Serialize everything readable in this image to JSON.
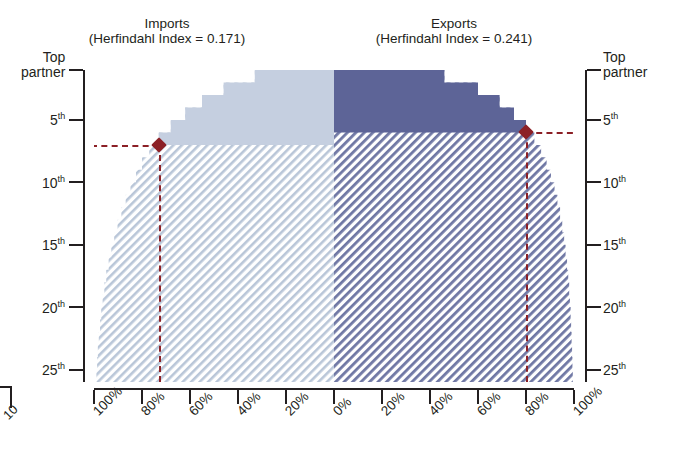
{
  "figure": {
    "background": "#ffffff",
    "accent_marker_color": "#8c2026",
    "imports_fill_color": "#c5cfe0",
    "exports_fill_color": "#5d6497",
    "axis_color": "#231f20"
  },
  "panels": {
    "left": {
      "title": "Imports",
      "subtitle": "(Herfindahl Index = 0.171)"
    },
    "right": {
      "title": "Exports",
      "subtitle": "(Herfindahl Index = 0.241)"
    }
  },
  "y_axis_left": {
    "top_label_line1": "Top",
    "top_label_line2": "partner",
    "ticks": [
      {
        "value": 1,
        "label": "Top partner",
        "two_line": true
      },
      {
        "value": 5,
        "label": "5",
        "suffix": "th"
      },
      {
        "value": 10,
        "label": "10",
        "suffix": "th"
      },
      {
        "value": 15,
        "label": "15",
        "suffix": "th"
      },
      {
        "value": 20,
        "label": "20",
        "suffix": "th"
      },
      {
        "value": 25,
        "label": "25",
        "suffix": "th"
      }
    ]
  },
  "y_axis_right": {
    "top_label_line1": "Top",
    "top_label_line2": "partner",
    "ticks": [
      {
        "value": 1,
        "label": "Top partner",
        "two_line": true
      },
      {
        "value": 5,
        "label": "5",
        "suffix": "th"
      },
      {
        "value": 10,
        "label": "10",
        "suffix": "th"
      },
      {
        "value": 15,
        "label": "15",
        "suffix": "th"
      },
      {
        "value": 20,
        "label": "20",
        "suffix": "th"
      },
      {
        "value": 25,
        "label": "25",
        "suffix": "th"
      }
    ]
  },
  "x_axis": {
    "tick_labels": [
      "100%",
      "80%",
      "60%",
      "40%",
      "20%",
      "0%",
      "20%",
      "40%",
      "60%",
      "80%",
      "100%"
    ]
  },
  "markers": {
    "imports": {
      "rank": 6,
      "share_label": "80%"
    },
    "exports": {
      "rank": 5,
      "share_label": "80%"
    }
  },
  "crop_artifact": {
    "label": "10"
  },
  "chart_data": {
    "type": "area",
    "subtitle": "",
    "xlabel": "",
    "ylabel": "Partner rank",
    "grid": false,
    "legend_position": "top",
    "orientation": "back-to-back cumulative step (butterfly)",
    "y_inverted": true,
    "ylim": [
      1,
      25
    ],
    "y_tick_values": [
      1,
      5,
      10,
      15,
      20,
      25
    ],
    "y_tick_labels": [
      "Top partner",
      "5th",
      "10th",
      "15th",
      "20th",
      "25th"
    ],
    "x_tick_labels": [
      "100%",
      "80%",
      "60%",
      "40%",
      "20%",
      "0%",
      "20%",
      "40%",
      "60%",
      "80%",
      "100%"
    ],
    "x_left_range_percent": [
      100,
      0
    ],
    "x_right_range_percent": [
      0,
      100
    ],
    "series": [
      {
        "name": "Imports",
        "side": "left",
        "herfindahl_index": 0.171,
        "color": "#c5cfe0",
        "annotation_rank": 6,
        "annotation_share": 80,
        "ranks": [
          1,
          2,
          3,
          4,
          5,
          6,
          7,
          8,
          9,
          10,
          11,
          12,
          13,
          14,
          15,
          16,
          17,
          18,
          19,
          20,
          21,
          22,
          23,
          24,
          25
        ],
        "cumulative_share_percent": [
          33,
          46,
          55,
          62,
          68,
          73,
          77,
          80,
          82.5,
          84.8,
          86.8,
          88.6,
          90.2,
          91.6,
          92.8,
          93.9,
          94.9,
          95.7,
          96.4,
          97.0,
          97.5,
          98.0,
          98.4,
          98.7,
          99.0
        ]
      },
      {
        "name": "Exports",
        "side": "right",
        "herfindahl_index": 0.241,
        "color": "#5d6497",
        "annotation_rank": 5,
        "annotation_share": 80,
        "ranks": [
          1,
          2,
          3,
          4,
          5,
          6,
          7,
          8,
          9,
          10,
          11,
          12,
          13,
          14,
          15,
          16,
          17,
          18,
          19,
          20,
          21,
          22,
          23,
          24,
          25
        ],
        "cumulative_share_percent": [
          46,
          60,
          69,
          75,
          80,
          83.5,
          86.3,
          88.6,
          90.4,
          91.9,
          93.1,
          94.2,
          95.1,
          95.9,
          96.5,
          97.1,
          97.6,
          98.0,
          98.3,
          98.6,
          98.8,
          99.0,
          99.2,
          99.35,
          99.5
        ]
      }
    ],
    "annotations": [
      {
        "text": "Imports (Herfindahl Index = 0.171)",
        "target": "left panel"
      },
      {
        "text": "Exports (Herfindahl Index = 0.241)",
        "target": "right panel"
      }
    ]
  }
}
